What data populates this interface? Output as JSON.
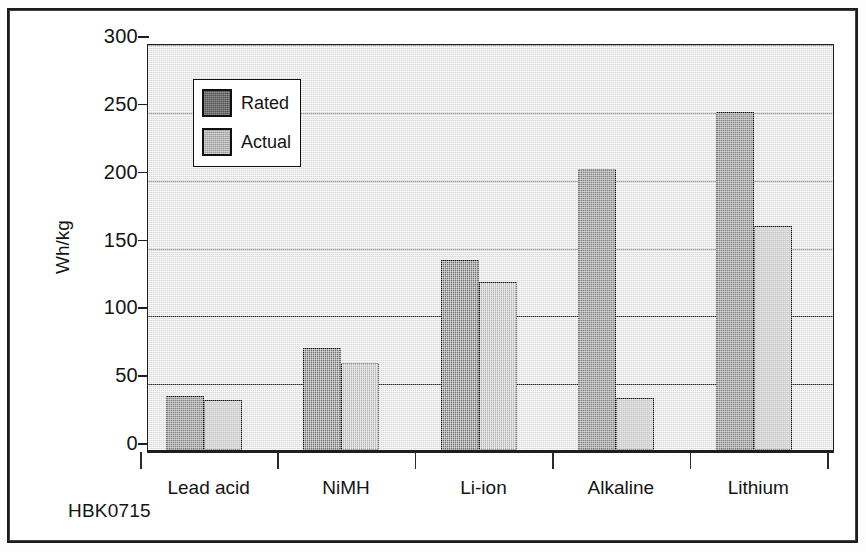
{
  "figure": {
    "id_label": "HBK0715"
  },
  "chart_data": {
    "type": "bar",
    "title": "",
    "xlabel": "",
    "ylabel": "Wh/kg",
    "ylim": [
      0,
      300
    ],
    "ytick_step": 50,
    "ytick_labels": [
      "0",
      "50",
      "100",
      "150",
      "200",
      "250",
      "300"
    ],
    "ytick_values": [
      0,
      50,
      100,
      150,
      200,
      250,
      300
    ],
    "grid": true,
    "grid_axis": "y",
    "legend_position": "upper left inside plot",
    "categories": [
      "Lead acid",
      "NiMH",
      "Li-ion",
      "Alkaline",
      "Lithium"
    ],
    "series": [
      {
        "name": "Rated",
        "color": "#6e6e6e",
        "values": [
          40,
          75,
          140,
          207,
          249
        ]
      },
      {
        "name": "Actual",
        "color": "#bdbdbd",
        "values": [
          37,
          64,
          124,
          38,
          165
        ]
      }
    ]
  }
}
